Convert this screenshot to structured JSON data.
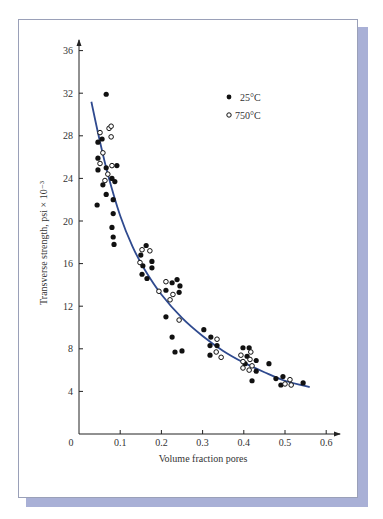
{
  "chart_data": {
    "type": "scatter",
    "title": "",
    "xlabel": "Volume fraction pores",
    "ylabel": "Transverse strength, psi × 10⁻³",
    "xlim": [
      0,
      0.6
    ],
    "ylim": [
      0,
      36
    ],
    "x_ticks": [
      "0",
      "0.1",
      "0.2",
      "0.3",
      "0.4",
      "0.5",
      "0.6"
    ],
    "y_ticks": [
      "4",
      "8",
      "12",
      "16",
      "20",
      "24",
      "28",
      "32",
      "36"
    ],
    "grid": false,
    "legend_position": "upper right",
    "series": [
      {
        "name": "25°C",
        "marker": "filled-circle",
        "points": [
          [
            0.066,
            31.9
          ],
          [
            0.046,
            27.4
          ],
          [
            0.056,
            27.7
          ],
          [
            0.046,
            25.9
          ],
          [
            0.046,
            24.8
          ],
          [
            0.066,
            25.0
          ],
          [
            0.092,
            25.2
          ],
          [
            0.08,
            24.0
          ],
          [
            0.087,
            23.7
          ],
          [
            0.058,
            23.4
          ],
          [
            0.044,
            21.5
          ],
          [
            0.066,
            22.5
          ],
          [
            0.083,
            22.0
          ],
          [
            0.083,
            20.7
          ],
          [
            0.08,
            19.4
          ],
          [
            0.083,
            18.5
          ],
          [
            0.085,
            17.8
          ],
          [
            0.163,
            17.7
          ],
          [
            0.15,
            16.8
          ],
          [
            0.177,
            16.2
          ],
          [
            0.155,
            15.8
          ],
          [
            0.177,
            15.6
          ],
          [
            0.153,
            15.0
          ],
          [
            0.165,
            14.6
          ],
          [
            0.238,
            14.5
          ],
          [
            0.226,
            14.2
          ],
          [
            0.245,
            13.9
          ],
          [
            0.243,
            13.3
          ],
          [
            0.211,
            13.5
          ],
          [
            0.211,
            11.0
          ],
          [
            0.226,
            9.1
          ],
          [
            0.233,
            7.7
          ],
          [
            0.25,
            7.8
          ],
          [
            0.303,
            9.8
          ],
          [
            0.32,
            9.1
          ],
          [
            0.318,
            8.3
          ],
          [
            0.335,
            8.3
          ],
          [
            0.318,
            7.4
          ],
          [
            0.398,
            8.1
          ],
          [
            0.413,
            8.1
          ],
          [
            0.408,
            7.3
          ],
          [
            0.403,
            6.6
          ],
          [
            0.43,
            6.9
          ],
          [
            0.43,
            5.9
          ],
          [
            0.42,
            5.0
          ],
          [
            0.461,
            6.6
          ],
          [
            0.478,
            5.2
          ],
          [
            0.495,
            5.4
          ],
          [
            0.49,
            4.6
          ],
          [
            0.544,
            4.8
          ]
        ]
      },
      {
        "name": "750°C",
        "marker": "open-circle",
        "points": [
          [
            0.051,
            28.3
          ],
          [
            0.073,
            28.7
          ],
          [
            0.078,
            28.9
          ],
          [
            0.078,
            27.9
          ],
          [
            0.058,
            26.4
          ],
          [
            0.051,
            25.4
          ],
          [
            0.08,
            25.2
          ],
          [
            0.07,
            24.4
          ],
          [
            0.063,
            23.8
          ],
          [
            0.153,
            17.3
          ],
          [
            0.172,
            17.2
          ],
          [
            0.148,
            16.1
          ],
          [
            0.211,
            14.3
          ],
          [
            0.228,
            13.1
          ],
          [
            0.194,
            13.4
          ],
          [
            0.221,
            12.6
          ],
          [
            0.243,
            10.7
          ],
          [
            0.335,
            8.9
          ],
          [
            0.333,
            7.7
          ],
          [
            0.345,
            7.2
          ],
          [
            0.393,
            7.4
          ],
          [
            0.417,
            7.7
          ],
          [
            0.415,
            7.0
          ],
          [
            0.398,
            6.8
          ],
          [
            0.398,
            6.2
          ],
          [
            0.42,
            6.4
          ],
          [
            0.413,
            6.0
          ],
          [
            0.512,
            5.1
          ],
          [
            0.5,
            4.7
          ],
          [
            0.515,
            4.6
          ]
        ]
      }
    ],
    "fit_curve": {
      "name": "fit",
      "color": "#2f4a8f",
      "points": [
        [
          0.03,
          31.2
        ],
        [
          0.05,
          27.6
        ],
        [
          0.07,
          24.4
        ],
        [
          0.1,
          20.5
        ],
        [
          0.13,
          17.6
        ],
        [
          0.16,
          15.4
        ],
        [
          0.2,
          13.1
        ],
        [
          0.25,
          10.9
        ],
        [
          0.3,
          9.2
        ],
        [
          0.35,
          7.8
        ],
        [
          0.4,
          6.7
        ],
        [
          0.45,
          5.8
        ],
        [
          0.5,
          5.0
        ],
        [
          0.56,
          4.4
        ]
      ]
    }
  },
  "legend": {
    "items": [
      {
        "label": "25°C",
        "marker": "filled-circle"
      },
      {
        "label": "750°C",
        "marker": "open-circle"
      }
    ]
  },
  "colors": {
    "curve": "#2f4a8f",
    "marker": "#111111",
    "shadow": "#a9b0d6",
    "axis": "#222222"
  }
}
